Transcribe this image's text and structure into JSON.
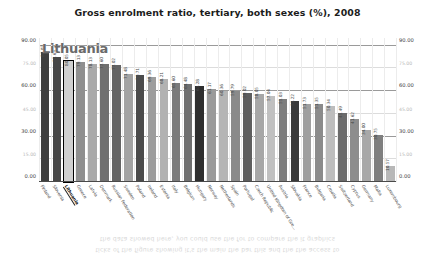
{
  "chart_title": "Gross enrolment ratio, tertiary, both sexes (%), 2008",
  "tooltip": {
    "label": "Lithuania"
  },
  "ghost": {
    "text": "ticks of the figure showing it's the main the bar this and the the access to\nthe data showed here, you could use the for to compare the it graphics"
  },
  "axis": {
    "y_ticks_major": [
      "90.00",
      "60.00",
      "30.00",
      "0.00"
    ],
    "y_ticks_minor": [
      "75.00",
      "45.00",
      "15.00"
    ],
    "y_max": 95,
    "y_min": 0
  },
  "chart_data": {
    "type": "bar",
    "title": "Gross enrolment ratio, tertiary, both sexes (%), 2008",
    "xlabel": "",
    "ylabel": "",
    "ylim": [
      0,
      95
    ],
    "grid": true,
    "legend": false,
    "highlight_category": "Lithuania",
    "categories": [
      "Finland",
      "Slovenia",
      "Lithuania",
      "Greece",
      "Latvia",
      "Denmark",
      "Russian Federation",
      "Sweden",
      "Poland",
      "Ireland",
      "Estonia",
      "Italy",
      "Belgium",
      "Hungary",
      "Norway",
      "Netherlands",
      "Spain",
      "Portugal",
      "Czech Republic",
      "United Kingdom of Gre...",
      "Austria",
      "Slovakia",
      "France",
      "Bulgaria",
      "Croatia",
      "Switzerland",
      "Cyprus",
      "Germany",
      "Malta",
      "Luxembourg"
    ],
    "values": [
      86.02,
      82.63,
      80.05,
      79.13,
      78.13,
      77.6,
      77.02,
      71.48,
      70.71,
      69.36,
      68.21,
      65.6,
      64.48,
      63.28,
      61.17,
      60.36,
      59.79,
      59.02,
      58.05,
      57.04,
      55.03,
      53.22,
      51.73,
      51.35,
      50.34,
      45.49,
      41.62,
      34.0,
      30.75,
      10.57
    ],
    "value_labels": [
      "86.02",
      "82.63",
      "80.05",
      "79.13",
      "78.13",
      "77.60",
      "77.02",
      "71.48",
      "70.71",
      "69.36",
      "68.21",
      "65.60",
      "64.48",
      "63.28",
      "61.17",
      "60.36",
      "59.79",
      "59.02",
      "58.05",
      "57.04",
      "55.03",
      "53.22",
      "51.73",
      "51.35",
      "50.34",
      "45.49",
      "41.62",
      "34.00",
      "30.75",
      "10.57"
    ],
    "bar_colors": [
      "#3f3f3f",
      "#464646",
      "#cfcfcf",
      "#8f8f8f",
      "#a9a9a9",
      "#707070",
      "#646464",
      "#a3a3a3",
      "#4b4b4b",
      "#9d9d9d",
      "#b2b2b2",
      "#7b7b7b",
      "#6f6f6f",
      "#2e2e2e",
      "#9a9a9a",
      "#b5b5b5",
      "#8a8a8a",
      "#5e5e5e",
      "#a7a7a7",
      "#c0c0c0",
      "#7d7d7d",
      "#3a3a3a",
      "#9f9f9f",
      "#8b8b8b",
      "#bdbdbd",
      "#6b6b6b",
      "#8d8d8d",
      "#a8a8a8",
      "#7f7f7f",
      "#b8b8b8"
    ]
  }
}
